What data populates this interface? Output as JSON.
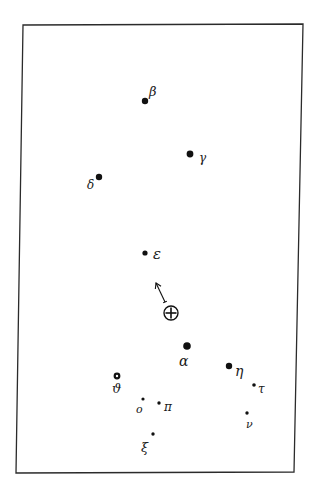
{
  "diagram": {
    "title": "",
    "colors": {
      "ink": "#111111",
      "background": "#ffffff",
      "frame": "#2b2b2b"
    },
    "frame": {
      "corners": [
        [
          23,
          25
        ],
        [
          303,
          24
        ],
        [
          294,
          472
        ],
        [
          16,
          473
        ]
      ]
    },
    "stars": [
      {
        "id": "beta",
        "label": "β",
        "x": 145,
        "y": 101,
        "r": 3.2,
        "style": "filled",
        "label_x": 149,
        "label_y": 96,
        "label_size": 13
      },
      {
        "id": "gamma",
        "label": "γ",
        "x": 190,
        "y": 154,
        "r": 3.4,
        "style": "filled",
        "label_x": 199,
        "label_y": 162,
        "label_size": 12
      },
      {
        "id": "delta",
        "label": "δ",
        "x": 99,
        "y": 177,
        "r": 3.2,
        "style": "filled",
        "label_x": 87,
        "label_y": 189,
        "label_size": 12
      },
      {
        "id": "epsilon",
        "label": "ε",
        "x": 145,
        "y": 253,
        "r": 2.6,
        "style": "filled",
        "label_x": 153,
        "label_y": 259,
        "label_size": 15
      },
      {
        "id": "alpha",
        "label": "α",
        "x": 187,
        "y": 346,
        "r": 3.8,
        "style": "filled",
        "label_x": 179,
        "label_y": 366,
        "label_size": 14
      },
      {
        "id": "eta",
        "label": "η",
        "x": 229,
        "y": 366,
        "r": 3.2,
        "style": "filled",
        "label_x": 235,
        "label_y": 376,
        "label_size": 14
      },
      {
        "id": "tau",
        "label": "τ",
        "x": 254,
        "y": 385,
        "r": 1.8,
        "style": "filled",
        "label_x": 258,
        "label_y": 393,
        "label_size": 12
      },
      {
        "id": "upsilon",
        "label": "ν",
        "x": 247,
        "y": 413,
        "r": 1.7,
        "style": "filled",
        "label_x": 246,
        "label_y": 428,
        "label_size": 11
      },
      {
        "id": "theta",
        "label": "ϑ",
        "x": 117,
        "y": 376,
        "r": 2.8,
        "style": "ring",
        "label_x": 112,
        "label_y": 393,
        "label_size": 13
      },
      {
        "id": "omicron",
        "label": "ο",
        "x": 143,
        "y": 399,
        "r": 1.6,
        "style": "filled",
        "label_x": 136,
        "label_y": 413,
        "label_size": 11
      },
      {
        "id": "pi",
        "label": "π",
        "x": 159,
        "y": 403,
        "r": 1.7,
        "style": "filled",
        "label_x": 164,
        "label_y": 411,
        "label_size": 12
      },
      {
        "id": "xi",
        "label": "ξ",
        "x": 153,
        "y": 434,
        "r": 1.7,
        "style": "filled",
        "label_x": 141,
        "label_y": 452,
        "label_size": 13
      }
    ],
    "earth": {
      "symbol": "⊕",
      "x": 171,
      "y": 313,
      "r": 7
    },
    "arrow": {
      "from": [
        165,
        302
      ],
      "to": [
        156,
        283
      ],
      "description": "direction of motion"
    }
  }
}
